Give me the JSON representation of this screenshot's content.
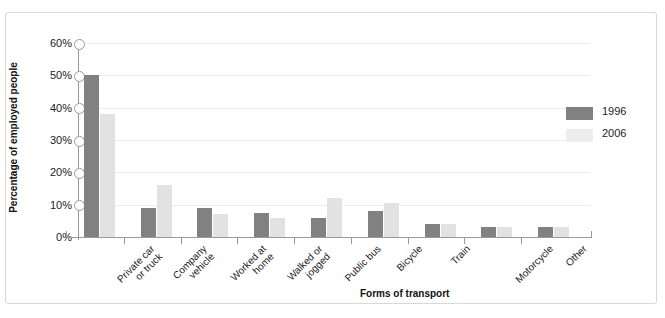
{
  "figure": {
    "top_partial_text": "",
    "y_axis_title": "Percentage of employed people",
    "x_axis_title": "Forms of transport"
  },
  "legend": {
    "position": "right",
    "items": [
      {
        "label": "1996",
        "color": "#818181"
      },
      {
        "label": "2006",
        "color": "#ededed"
      }
    ]
  },
  "axis": {
    "y_ticks": [
      "60%",
      "50%",
      "40%",
      "30%",
      "20%",
      "10%",
      "0%"
    ]
  },
  "chart_data": {
    "type": "bar",
    "title": "",
    "xlabel": "Forms of transport",
    "ylabel": "Percentage of employed people",
    "ylim": [
      0,
      60
    ],
    "ytick_values": [
      0,
      10,
      20,
      30,
      40,
      50,
      60
    ],
    "ytick_labels": [
      "0%",
      "10%",
      "20%",
      "30%",
      "40%",
      "50%",
      "60%"
    ],
    "grid": true,
    "legend_position": "right",
    "categories": [
      "Private car or truck",
      "Company vehicle",
      "Worked at home",
      "Walked or jogged",
      "Public bus",
      "Bicycle",
      "Train",
      "Motorcycle",
      "Other"
    ],
    "category_lines": [
      [
        "Private car",
        "or truck"
      ],
      [
        "Company",
        "vehicle"
      ],
      [
        "Worked at",
        "home"
      ],
      [
        "Walked or",
        "jogged"
      ],
      [
        "Public bus"
      ],
      [
        "Bicycle"
      ],
      [
        "Train"
      ],
      [
        "Motorcycle"
      ],
      [
        "Other"
      ]
    ],
    "series": [
      {
        "name": "1996",
        "color": "#818181",
        "values": [
          50,
          9,
          9,
          7.5,
          6,
          8,
          4,
          3,
          3
        ]
      },
      {
        "name": "2006",
        "color": "#e2e2e2",
        "values": [
          38,
          16,
          7,
          6,
          12,
          10.5,
          4,
          3,
          3
        ]
      }
    ]
  }
}
